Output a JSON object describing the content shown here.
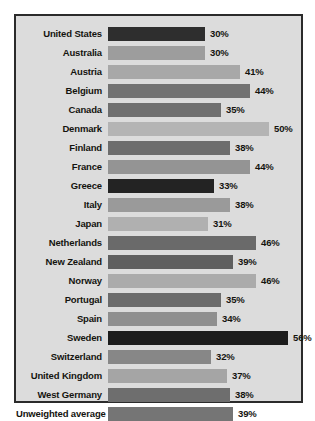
{
  "chart_data": {
    "type": "bar",
    "orientation": "horizontal",
    "title": "",
    "subtitle": "",
    "xlabel": "",
    "ylabel": "",
    "xlim": [
      0,
      60
    ],
    "grid": false,
    "legend": null,
    "value_suffix": "%",
    "categories": [
      "United States",
      "Australia",
      "Austria",
      "Belgium",
      "Canada",
      "Denmark",
      "Finland",
      "France",
      "Greece",
      "Italy",
      "Japan",
      "Netherlands",
      "New Zealand",
      "Norway",
      "Portugal",
      "Spain",
      "Sweden",
      "Switzerland",
      "United Kingdom",
      "West Germany",
      "Unweighted average"
    ],
    "values": [
      30,
      30,
      41,
      44,
      35,
      50,
      38,
      44,
      33,
      38,
      31,
      46,
      39,
      46,
      35,
      34,
      56,
      32,
      37,
      38,
      39
    ],
    "value_labels": [
      "30%",
      "30%",
      "41%",
      "44%",
      "35%",
      "50%",
      "38%",
      "44%",
      "33%",
      "38%",
      "31%",
      "46%",
      "39%",
      "46%",
      "35%",
      "34%",
      "56%",
      "32%",
      "37%",
      "38%",
      "39%"
    ],
    "bar_colors": [
      "#2e2e2e",
      "#9d9d9d",
      "#a8a8a8",
      "#727272",
      "#6f6f6f",
      "#b4b4b4",
      "#6d6d6d",
      "#949494",
      "#232323",
      "#9a9a9a",
      "#b0b0b0",
      "#6a6a6a",
      "#5f5f5f",
      "#ababab",
      "#6b6b6b",
      "#8f8f8f",
      "#1c1c1c",
      "#878787",
      "#a5a5a5",
      "#6e6e6e",
      "#757575"
    ]
  },
  "figure": {
    "border_color": "#2b2b2b",
    "background_color": "#dcdcdc",
    "page_background": "#ffffff"
  }
}
